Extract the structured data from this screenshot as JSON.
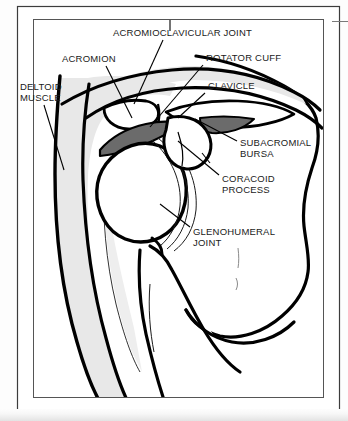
{
  "figure": {
    "view": "anterior coronal cross-section of the right shoulder",
    "colors": {
      "ink": "#000000",
      "paper": "#ffffff",
      "page_background": "#fdfdfd",
      "deltoid_fill": "#e8e8e8",
      "bursa_fill": "#6b6b6b",
      "frame_line": "#4a4a4a",
      "scan_shadow": "#4a4a4a"
    },
    "frame": {
      "outer_label": "outer-page-border",
      "inner_label": "inner-figure-border"
    },
    "labels": [
      {
        "id": "acromioclavicular-joint",
        "text": "ACROMIOCLAVICULAR JOINT",
        "lines": [
          "ACROMIOCLAVICULAR JOINT"
        ],
        "text_x": 113,
        "text_y": 36,
        "anchor": "start",
        "leader": "M 170 28 L 170 22",
        "leader2": "M 165 40 L 133 100"
      },
      {
        "id": "acromion",
        "text": "ACROMION",
        "lines": [
          "ACROMION"
        ],
        "text_x": 62,
        "text_y": 62,
        "anchor": "start",
        "leader": "M 110 66 L 130 112"
      },
      {
        "id": "rotator-cuff",
        "text": "ROTATOR CUFF",
        "lines": [
          "ROTATOR CUFF"
        ],
        "text_x": 206,
        "text_y": 61,
        "anchor": "start",
        "leader": "M 204 64 L 147 124"
      },
      {
        "id": "clavicle",
        "text": "CLAVICLE",
        "lines": [
          "CLAVICLE"
        ],
        "text_x": 208,
        "text_y": 89,
        "anchor": "start",
        "leader": "M 206 92 L 176 118"
      },
      {
        "id": "deltoid-muscle",
        "text": "DELTOID MUSCLE",
        "lines": [
          "DELTOID",
          "MUSCLE"
        ],
        "text_x": 20,
        "text_y": 90,
        "anchor": "start",
        "leader": "M 44 104 L 62 168"
      },
      {
        "id": "subacromial-bursa",
        "text": "SUBACROMIAL BURSA",
        "lines": [
          "SUBACROMIAL",
          "BURSA"
        ],
        "text_x": 240,
        "text_y": 146,
        "anchor": "start",
        "leader": "M 238 142 L 196 118"
      },
      {
        "id": "coracoid-process",
        "text": "CORACOID PROCESS",
        "lines": [
          "CORACOID",
          "PROCESS"
        ],
        "text_x": 222,
        "text_y": 182,
        "anchor": "start",
        "leader": "M 220 176 L 176 140"
      },
      {
        "id": "glenohumeral-joint",
        "text": "GLENOHUMERAL JOINT",
        "lines": [
          "GLENOHUMERAL",
          "JOINT"
        ],
        "text_x": 193,
        "text_y": 235,
        "anchor": "start",
        "leader": "M 191 228 L 163 206"
      }
    ],
    "structures": [
      {
        "id": "deltoid-muscle-shape",
        "name": "deltoid muscle",
        "fill": "#e8e8e8"
      },
      {
        "id": "subacromial-bursa-shape",
        "name": "subacromial bursa",
        "fill": "#6b6b6b"
      },
      {
        "id": "humeral-head-shape",
        "name": "humeral head",
        "fill": "#ffffff"
      },
      {
        "id": "clavicle-shape",
        "name": "clavicle",
        "fill": "#ffffff"
      },
      {
        "id": "acromion-shape",
        "name": "acromion",
        "fill": "#ffffff"
      },
      {
        "id": "coracoid-process-shape",
        "name": "coracoid process",
        "fill": "#ffffff"
      },
      {
        "id": "scapula-shape",
        "name": "scapula body",
        "fill": "#ffffff"
      },
      {
        "id": "humerus-shaft-shape",
        "name": "humerus shaft",
        "fill": "#ffffff"
      },
      {
        "id": "joint-capsule-lines",
        "name": "joint capsule",
        "fill": "none"
      },
      {
        "id": "torso-outline-shape",
        "name": "torso outline",
        "fill": "#ffffff"
      }
    ]
  }
}
